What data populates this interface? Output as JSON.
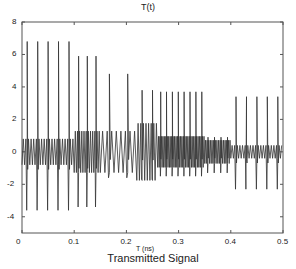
{
  "chart_data": {
    "type": "line",
    "title": "T(t)",
    "xlabel": "T (ns)",
    "ylabel": "",
    "caption": "Transmitted Signal",
    "xlim": [
      0,
      0.5
    ],
    "ylim": [
      -5,
      8
    ],
    "xticks": [
      "0",
      "0.1",
      "0.2",
      "0.3",
      "0.4",
      "0.5"
    ],
    "yticks": [
      "-4",
      "-2",
      "0",
      "2",
      "4",
      "6",
      "8"
    ],
    "grid": false,
    "legend": null,
    "series": [
      {
        "name": "T(t)",
        "segments": [
          {
            "t_start": 0.0,
            "t_end": 0.1,
            "peak_max": 6.8,
            "peak_min": -3.6,
            "pulse_count": 5,
            "inter_pulse_amplitude": 1.0
          },
          {
            "t_start": 0.1,
            "t_end": 0.15,
            "peak_max": 5.9,
            "peak_min": -3.4,
            "pulse_count": 3,
            "inter_pulse_amplitude": 1.6
          },
          {
            "t_start": 0.15,
            "t_end": 0.22,
            "peak_max": 4.8,
            "peak_min": -1.6,
            "pulse_count": 2,
            "inter_pulse_amplitude": 1.6
          },
          {
            "t_start": 0.22,
            "t_end": 0.26,
            "peak_max": 3.8,
            "peak_min": -1.7,
            "pulse_count": 2,
            "inter_pulse_amplitude": 2.2
          },
          {
            "t_start": 0.26,
            "t_end": 0.35,
            "peak_max": 3.7,
            "peak_min": -1.5,
            "pulse_count": 8,
            "inter_pulse_amplitude": 1.2
          },
          {
            "t_start": 0.35,
            "t_end": 0.4,
            "peak_max": 0.9,
            "peak_min": -1.3,
            "pulse_count": 4,
            "inter_pulse_amplitude": 0.9
          },
          {
            "t_start": 0.4,
            "t_end": 0.5,
            "peak_max": 3.4,
            "peak_min": -2.3,
            "pulse_count": 5,
            "inter_pulse_amplitude": 0.5
          }
        ]
      }
    ]
  }
}
